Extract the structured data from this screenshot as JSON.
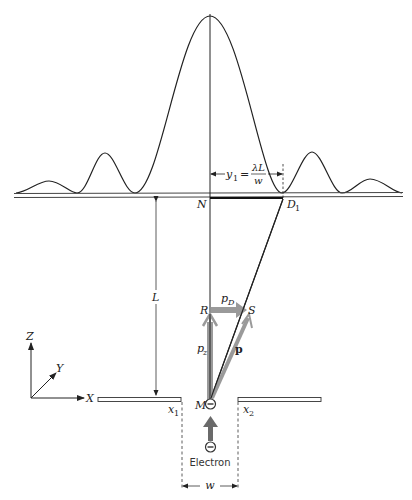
{
  "figure": {
    "type": "single-slit electron diffraction diagram",
    "colors": {
      "line": "#222222",
      "momentum_arrow": "#9a9a9a",
      "electron_arrow": "#6a6a6a",
      "background": "#ffffff"
    }
  },
  "pattern": {
    "description": "diffraction intensity curve",
    "central_peak": {
      "x": 210,
      "y": 16
    },
    "side_peaks": [
      {
        "x": 105,
        "y": 153
      },
      {
        "x": 312,
        "y": 152
      },
      {
        "x": 49,
        "y": 181
      },
      {
        "x": 370,
        "y": 179
      }
    ],
    "minima_x": [
      77,
      135,
      282,
      342
    ]
  },
  "labels": {
    "y1_equation_lhs": "y",
    "y1_sub": "1",
    "y1_equals": "=",
    "y1_numerator": "λL",
    "y1_denominator": "w",
    "N": "N",
    "D1": "D",
    "D1_sub": "1",
    "L": "L",
    "R": "R",
    "S": "S",
    "pD": "p",
    "pD_sub": "D",
    "pz": "p",
    "pz_sub": "z",
    "p": "p",
    "M": "M",
    "x1": "x",
    "x1_sub": "1",
    "x2": "x",
    "x2_sub": "2",
    "electron": "Electron",
    "electron_symbol": "−",
    "w": "w"
  },
  "axes": {
    "Z": "Z",
    "Y": "Y",
    "X": "X"
  }
}
